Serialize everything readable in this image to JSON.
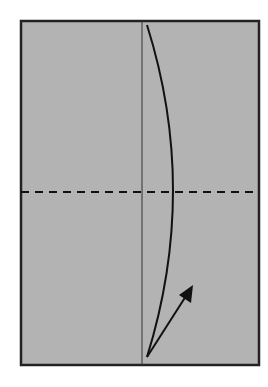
{
  "diagram": {
    "type": "origami-fold-step",
    "background": "#ffffff",
    "paper": {
      "x": 21,
      "y": 21,
      "width": 238,
      "height": 344,
      "fill": "#b3b3b3",
      "stroke": "#222222",
      "stroke_width": 2.5
    },
    "center_crease": {
      "x": 142,
      "y1": 21,
      "y2": 365,
      "stroke": "#333333",
      "stroke_width": 1
    },
    "valley_fold_line": {
      "y": 192,
      "x1": 21,
      "x2": 259,
      "stroke": "#111111",
      "dash": "8,6",
      "stroke_width": 2
    },
    "curved_edge": {
      "path": "M147,25 Q199,190 147,357",
      "stroke": "#111111",
      "stroke_width": 2
    },
    "arrow": {
      "x1": 147,
      "y1": 357,
      "x2": 193,
      "y2": 286,
      "stroke": "#111111",
      "stroke_width": 2
    }
  }
}
